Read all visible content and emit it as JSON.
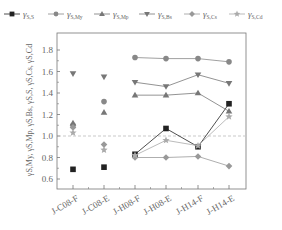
{
  "chart_data": {
    "type": "line",
    "title": "",
    "xlabel": "",
    "ylabel": "γS,My, γS,Mp, γS,Bs, γS,S, γS,Cs, γS,Cd",
    "ylim": [
      0.55,
      1.9
    ],
    "yticks": [
      0.6,
      0.8,
      1.0,
      1.2,
      1.4,
      1.6,
      1.8
    ],
    "ytick_labels": [
      "0.6",
      "0.8",
      "1.0",
      "1.2",
      "1.4",
      "1.6",
      "1.8"
    ],
    "reference_line": {
      "y": 1.0,
      "style": "dashed",
      "color": "#bbbbbb"
    },
    "categories": [
      "J-C08-F",
      "J-C08-E",
      "J-H08-F",
      "J-H08-E",
      "J-H14-F",
      "J-H14-E"
    ],
    "grid": false,
    "legend_position": "top",
    "connect_from_index": 2,
    "series": [
      {
        "name": "γS,S",
        "sub": "S,S",
        "marker": "square",
        "color": "#222222",
        "values": [
          0.69,
          0.71,
          0.83,
          1.07,
          0.9,
          1.3
        ]
      },
      {
        "name": "γS,My",
        "sub": "S,My",
        "marker": "circle",
        "color": "#888888",
        "values": [
          1.1,
          1.32,
          1.73,
          1.72,
          1.72,
          1.69
        ]
      },
      {
        "name": "γS,Mp",
        "sub": "S,Mp",
        "marker": "triangle-up",
        "color": "#777777",
        "values": [
          1.12,
          1.22,
          1.38,
          1.38,
          1.4,
          1.23
        ]
      },
      {
        "name": "γS,Bs",
        "sub": "S,Bs",
        "marker": "triangle-down",
        "color": "#777777",
        "values": [
          1.58,
          1.55,
          1.5,
          1.46,
          1.57,
          1.49
        ]
      },
      {
        "name": "γS,Cs",
        "sub": "S,Cs",
        "marker": "diamond",
        "color": "#999999",
        "values": [
          1.08,
          0.92,
          0.8,
          0.8,
          0.81,
          0.72
        ]
      },
      {
        "name": "γS,Cd",
        "sub": "S,Cd",
        "marker": "star",
        "color": "#aaaaaa",
        "values": [
          1.03,
          0.87,
          0.82,
          0.96,
          0.91,
          1.18
        ]
      }
    ]
  }
}
